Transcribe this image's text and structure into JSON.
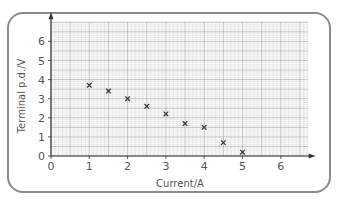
{
  "chart_data": {
    "type": "scatter",
    "title": "",
    "xlabel": "Current/A",
    "ylabel": "Terminal p.d./V",
    "xlim": [
      0,
      6.7
    ],
    "ylim": [
      0,
      7
    ],
    "xticks": [
      0,
      1,
      2,
      3,
      4,
      5,
      6
    ],
    "yticks": [
      0,
      1,
      2,
      3,
      4,
      5,
      6
    ],
    "grid": true,
    "marker": "x",
    "series": [
      {
        "name": "measurements",
        "x": [
          1.0,
          1.5,
          2.0,
          2.5,
          3.0,
          3.5,
          4.0,
          4.5,
          5.0
        ],
        "y": [
          3.7,
          3.4,
          3.0,
          2.6,
          2.2,
          1.7,
          1.5,
          0.7,
          0.2
        ]
      }
    ]
  },
  "labels": {
    "xlabel": "Current/A",
    "ylabel": "Terminal p.d./V"
  },
  "colors": {
    "frame": "#8a8a8a",
    "grid_minor": "#d6d6d6",
    "grid_major": "#b4b4b4",
    "axis": "#333333",
    "marker": "#333333"
  }
}
